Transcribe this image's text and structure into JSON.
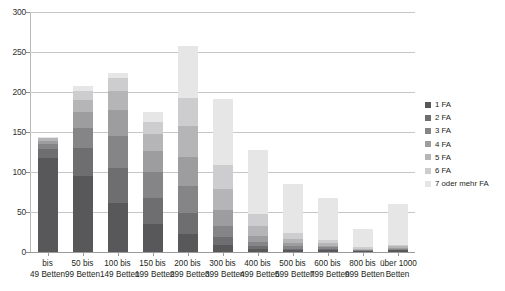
{
  "chart_data": {
    "type": "bar",
    "stacked": true,
    "title": "",
    "xlabel": "",
    "ylabel": "",
    "ylim": [
      0,
      300
    ],
    "yticks": [
      0,
      50,
      100,
      150,
      200,
      250,
      300
    ],
    "ytick_labels": [
      "0",
      "50",
      "100",
      "150",
      "200",
      "250",
      "300"
    ],
    "grid": true,
    "legend_position": "right",
    "categories": [
      "bis 49 Betten",
      "50 bis 99 Betten",
      "100 bis 149 Betten",
      "150 bis 199 Betten",
      "200 bis 299 Betten",
      "300 bis 399 Betten",
      "400 bis 499 Betten",
      "500 bis 599 Betten",
      "600 bis 799 Betten",
      "800 bis 999 Betten",
      "über 1000 Betten"
    ],
    "category_lines": [
      [
        "bis",
        "49 Betten"
      ],
      [
        "50 bis",
        "99 Betten"
      ],
      [
        "100 bis",
        "149 Betten"
      ],
      [
        "150 bis",
        "199 Betten"
      ],
      [
        "200 bis",
        "299 Betten"
      ],
      [
        "300 bis",
        "399 Betten"
      ],
      [
        "400 bis",
        "499 Betten"
      ],
      [
        "500 bis",
        "599 Betten"
      ],
      [
        "600 bis",
        "799 Betten"
      ],
      [
        "800 bis",
        "999 Betten"
      ],
      [
        "über 1000",
        "Betten"
      ]
    ],
    "totals": [
      144,
      208,
      224,
      175,
      257,
      191,
      128,
      85,
      67,
      29,
      60
    ],
    "series": [
      {
        "name": "1 FA",
        "color": "#58585a",
        "values": [
          117,
          95,
          61,
          35,
          22,
          9,
          4,
          2,
          3,
          1,
          2
        ]
      },
      {
        "name": "2 FA",
        "color": "#6e6e70",
        "values": [
          12,
          35,
          44,
          33,
          27,
          10,
          3,
          2,
          1,
          0,
          1
        ]
      },
      {
        "name": "3 FA",
        "color": "#858587",
        "values": [
          6,
          25,
          40,
          32,
          34,
          14,
          5,
          3,
          2,
          1,
          1
        ]
      },
      {
        "name": "4 FA",
        "color": "#9d9d9f",
        "values": [
          4,
          20,
          32,
          26,
          36,
          20,
          8,
          4,
          2,
          1,
          1
        ]
      },
      {
        "name": "5 FA",
        "color": "#b5b5b7",
        "values": [
          3,
          15,
          24,
          21,
          38,
          26,
          12,
          5,
          3,
          1,
          2
        ]
      },
      {
        "name": "6 FA",
        "color": "#cdcdcf",
        "values": [
          1,
          11,
          16,
          16,
          36,
          30,
          16,
          8,
          4,
          2,
          2
        ]
      },
      {
        "name": "7 oder mehr FA",
        "color": "#e6e6e7",
        "values": [
          1,
          7,
          7,
          12,
          64,
          82,
          80,
          61,
          52,
          23,
          51
        ]
      }
    ]
  },
  "legend": {
    "items": [
      {
        "label": "1 FA"
      },
      {
        "label": "2 FA"
      },
      {
        "label": "3 FA"
      },
      {
        "label": "4 FA"
      },
      {
        "label": "5 FA"
      },
      {
        "label": "6 FA"
      },
      {
        "label": "7 oder mehr FA"
      }
    ]
  }
}
